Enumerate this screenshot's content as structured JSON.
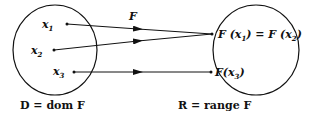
{
  "diagram": {
    "map_label": "F",
    "domain_set": {
      "caption": "D = dom F",
      "elements": [
        {
          "symbol": "x",
          "subscript": "1"
        },
        {
          "symbol": "x",
          "subscript": "2"
        },
        {
          "symbol": "x",
          "subscript": "3"
        }
      ]
    },
    "range_set": {
      "caption": "R = range F",
      "images": [
        {
          "text_parts": [
            "F (",
            "x",
            "1",
            ") = F (",
            "x",
            "2",
            ")"
          ],
          "from": [
            0,
            1
          ]
        },
        {
          "text_parts": [
            "F(",
            "x",
            "3",
            ")"
          ],
          "from": [
            2
          ]
        }
      ]
    },
    "colors": {
      "ink": "#111111",
      "background": "#ffffff"
    }
  }
}
